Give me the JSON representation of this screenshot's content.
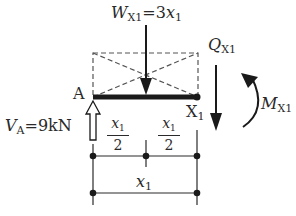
{
  "diagram": {
    "type": "free-body diagram of beam segment",
    "labels": {
      "load": {
        "symbol": "W",
        "subscript": "X1",
        "rhs": "=3",
        "var": "x",
        "var_sub": "1"
      },
      "shear": {
        "symbol": "Q",
        "subscript": "X1"
      },
      "moment": {
        "symbol": "M",
        "subscript": "X1"
      },
      "support_point": "A",
      "section_point": {
        "letter": "X",
        "sub": "1"
      },
      "reaction": {
        "symbol": "V",
        "subscript": "A",
        "rhs": "=9kN"
      }
    },
    "dimensions": {
      "half_left": {
        "num_var": "x",
        "num_sub": "1",
        "den": "2"
      },
      "half_right": {
        "num_var": "x",
        "num_sub": "1",
        "den": "2"
      },
      "total": {
        "var": "x",
        "sub": "1"
      }
    },
    "colors": {
      "ink": "#2a2a2a",
      "dash": "#555555",
      "background": "#ffffff"
    }
  }
}
